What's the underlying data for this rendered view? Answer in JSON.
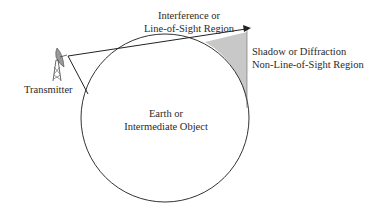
{
  "diagram": {
    "labels": {
      "los_region_line1": "Interference or",
      "los_region_line2": "Line-of-Sight Region",
      "shadow_region_line1": "Shadow or Diffraction",
      "shadow_region_line2": "Non-Line-of-Sight Region",
      "transmitter": "Transmitter",
      "object_line1": "Earth or",
      "object_line2": "Intermediate Object"
    },
    "icons": [
      "transmitter-tower-icon"
    ],
    "colors": {
      "stroke": "#333333",
      "shadow_fill": "#c8c8c8",
      "background": "#ffffff"
    }
  }
}
